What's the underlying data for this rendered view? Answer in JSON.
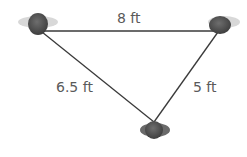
{
  "diagram": {
    "nodes": [
      {
        "id": "top-left",
        "label": "person",
        "x": 40,
        "y": 30
      },
      {
        "id": "top-right",
        "label": "person",
        "x": 220,
        "y": 30
      },
      {
        "id": "bottom",
        "label": "person",
        "x": 154,
        "y": 126
      }
    ],
    "edges": [
      {
        "from": "top-left",
        "to": "top-right",
        "label": "8 ft"
      },
      {
        "from": "top-left",
        "to": "bottom",
        "label": "6.5 ft"
      },
      {
        "from": "top-right",
        "to": "bottom",
        "label": "5 ft"
      }
    ],
    "colors": {
      "line": "#3a3a3a",
      "text": "#5a5a5a",
      "head": "#555555"
    }
  }
}
